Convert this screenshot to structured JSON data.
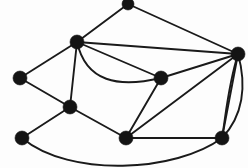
{
  "figure": {
    "background_color": "#fdfdfd",
    "node_color": "#141414",
    "edge_color": "#1a1a1a",
    "node_radius": 6,
    "edge_width": 1.9,
    "width": 248,
    "height": 168,
    "node_count": 9,
    "edge_count": 18
  },
  "graph_data": {
    "type": "graph",
    "directed": false,
    "nodes": [
      {
        "id": "n1",
        "label": "top",
        "x": 128,
        "y": 4,
        "r": 6
      },
      {
        "id": "n2",
        "label": "upper-left-hub",
        "x": 77,
        "y": 42,
        "r": 7
      },
      {
        "id": "n3",
        "label": "right-hub",
        "x": 238,
        "y": 54,
        "r": 7
      },
      {
        "id": "n4",
        "label": "left",
        "x": 20,
        "y": 78,
        "r": 7
      },
      {
        "id": "n5",
        "label": "center",
        "x": 161,
        "y": 78,
        "r": 7
      },
      {
        "id": "n6",
        "label": "mid-left",
        "x": 70,
        "y": 107,
        "r": 7
      },
      {
        "id": "n7",
        "label": "bottom-left",
        "x": 22,
        "y": 138,
        "r": 7
      },
      {
        "id": "n8",
        "label": "bottom-center",
        "x": 126,
        "y": 138,
        "r": 7
      },
      {
        "id": "n9",
        "label": "bottom-right",
        "x": 222,
        "y": 138,
        "r": 7
      }
    ],
    "edges": [
      {
        "id": "e1",
        "source": "n1",
        "target": "n2",
        "shape": "straight"
      },
      {
        "id": "e2",
        "source": "n1",
        "target": "n3",
        "shape": "straight"
      },
      {
        "id": "e3",
        "source": "n2",
        "target": "n3",
        "shape": "straight"
      },
      {
        "id": "e4",
        "source": "n2",
        "target": "n4",
        "shape": "straight"
      },
      {
        "id": "e5",
        "source": "n2",
        "target": "n5",
        "shape": "straight"
      },
      {
        "id": "e6",
        "source": "n2",
        "target": "n5",
        "shape": "curved-below"
      },
      {
        "id": "e7",
        "source": "n2",
        "target": "n6",
        "shape": "straight"
      },
      {
        "id": "e8",
        "source": "n3",
        "target": "n5",
        "shape": "straight"
      },
      {
        "id": "e9",
        "source": "n3",
        "target": "n8",
        "shape": "straight"
      },
      {
        "id": "e10",
        "source": "n3",
        "target": "n9",
        "shape": "straight"
      },
      {
        "id": "e11",
        "source": "n3",
        "target": "n9",
        "shape": "curved-right"
      },
      {
        "id": "e12",
        "source": "n4",
        "target": "n6",
        "shape": "straight"
      },
      {
        "id": "e13",
        "source": "n5",
        "target": "n8",
        "shape": "straight"
      },
      {
        "id": "e14",
        "source": "n6",
        "target": "n7",
        "shape": "straight"
      },
      {
        "id": "e15",
        "source": "n6",
        "target": "n8",
        "shape": "straight"
      },
      {
        "id": "e16",
        "source": "n7",
        "target": "n9",
        "shape": "curved-below"
      },
      {
        "id": "e17",
        "source": "n8",
        "target": "n9",
        "shape": "straight"
      },
      {
        "id": "e18",
        "source": "n3",
        "target": "n9",
        "shape": "curved-left"
      }
    ],
    "edge_paths": [
      {
        "id": "e1",
        "d": "M 128 4 L 77 42"
      },
      {
        "id": "e2",
        "d": "M 128 4 L 238 54"
      },
      {
        "id": "e3",
        "d": "M 77 42 L 238 54"
      },
      {
        "id": "e4",
        "d": "M 77 42 L 20 78"
      },
      {
        "id": "e5",
        "d": "M 77 42 L 161 78"
      },
      {
        "id": "e6",
        "d": "M 77 42 C 86 82 118 88 161 78"
      },
      {
        "id": "e7",
        "d": "M 77 42 L 70 107"
      },
      {
        "id": "e8",
        "d": "M 161 78 L 238 54"
      },
      {
        "id": "e9",
        "d": "M 126 138 L 238 54"
      },
      {
        "id": "e10",
        "d": "M 238 54 L 222 138"
      },
      {
        "id": "e11",
        "d": "M 238 54 C 247 86 243 116 222 138"
      },
      {
        "id": "e12",
        "d": "M 20 78 L 70 107"
      },
      {
        "id": "e13",
        "d": "M 161 78 L 126 138"
      },
      {
        "id": "e14",
        "d": "M 70 107 L 22 138"
      },
      {
        "id": "e15",
        "d": "M 70 107 L 126 138"
      },
      {
        "id": "e16",
        "d": "M 22 138 C 70 178 176 172 222 138"
      },
      {
        "id": "e17",
        "d": "M 126 138 L 222 138"
      },
      {
        "id": "e18",
        "d": "M 238 54 C 228 86 226 114 222 138"
      }
    ]
  }
}
